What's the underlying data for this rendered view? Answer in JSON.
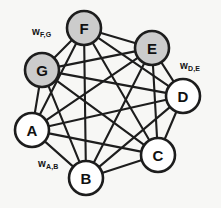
{
  "figure": {
    "background_color": "#f7f7f5",
    "width": 221,
    "height": 208
  },
  "style": {
    "edge_color": "#1d1d1d",
    "node_stroke_color": "#1d1d1d",
    "shaded_fill": "#cccccc",
    "plain_fill": "#ffffff",
    "node_radius": 17,
    "edge_width": 2.1,
    "node_stroke_width": 2.6
  },
  "chart_data": {
    "type": "diagram",
    "graph_type": "complete-graph",
    "node_count": 7,
    "edge_count": 21,
    "nodes": [
      {
        "id": "A",
        "label": "A",
        "cx": 32,
        "cy": 130,
        "r": 17,
        "fill": "#ffffff",
        "shaded": false
      },
      {
        "id": "B",
        "label": "B",
        "cx": 86,
        "cy": 178,
        "r": 17,
        "fill": "#ffffff",
        "shaded": false
      },
      {
        "id": "C",
        "label": "C",
        "cx": 158,
        "cy": 155,
        "r": 17,
        "fill": "#ffffff",
        "shaded": false
      },
      {
        "id": "D",
        "label": "D",
        "cx": 183,
        "cy": 96,
        "r": 17,
        "fill": "#ffffff",
        "shaded": false
      },
      {
        "id": "E",
        "label": "E",
        "cx": 152,
        "cy": 48,
        "r": 17,
        "fill": "#cccccc",
        "shaded": true
      },
      {
        "id": "F",
        "label": "F",
        "cx": 84,
        "cy": 28,
        "r": 17,
        "fill": "#cccccc",
        "shaded": true
      },
      {
        "id": "G",
        "label": "G",
        "cx": 42,
        "cy": 70,
        "r": 17,
        "fill": "#cccccc",
        "shaded": true
      }
    ],
    "edges": [
      [
        "A",
        "B"
      ],
      [
        "A",
        "C"
      ],
      [
        "A",
        "D"
      ],
      [
        "A",
        "E"
      ],
      [
        "A",
        "F"
      ],
      [
        "A",
        "G"
      ],
      [
        "B",
        "C"
      ],
      [
        "B",
        "D"
      ],
      [
        "B",
        "E"
      ],
      [
        "B",
        "F"
      ],
      [
        "B",
        "G"
      ],
      [
        "C",
        "D"
      ],
      [
        "C",
        "E"
      ],
      [
        "C",
        "F"
      ],
      [
        "C",
        "G"
      ],
      [
        "D",
        "E"
      ],
      [
        "D",
        "F"
      ],
      [
        "D",
        "G"
      ],
      [
        "E",
        "F"
      ],
      [
        "E",
        "G"
      ],
      [
        "F",
        "G"
      ]
    ],
    "edge_labels": [
      {
        "id": "w-fg",
        "base": "w",
        "subscript": "F,G",
        "edge": [
          "F",
          "G"
        ],
        "x": 32,
        "y": 26
      },
      {
        "id": "w-de",
        "base": "w",
        "subscript": "D,E",
        "edge": [
          "D",
          "E"
        ],
        "x": 180,
        "y": 60
      },
      {
        "id": "w-ab",
        "base": "w",
        "subscript": "A,B",
        "edge": [
          "A",
          "B"
        ],
        "x": 38,
        "y": 158
      }
    ]
  }
}
